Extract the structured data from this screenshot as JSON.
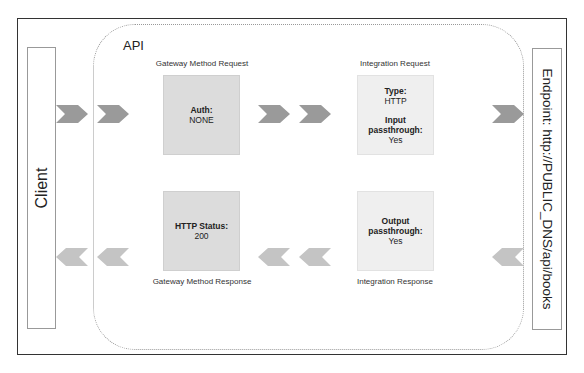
{
  "diagram": {
    "api_label": "API",
    "client_label": "Client",
    "endpoint_label": "Endpoint: http://PUBLIC_DNS/api/books",
    "request_flow": {
      "method_request": {
        "caption": "Gateway Method Request",
        "fields": [
          {
            "key": "Auth:",
            "value": "NONE"
          }
        ]
      },
      "integration_request": {
        "caption": "Integration Request",
        "fields": [
          {
            "key": "Type:",
            "value": "HTTP"
          },
          {
            "key": "Input passthrough:",
            "value": "Yes"
          }
        ]
      }
    },
    "response_flow": {
      "method_response": {
        "caption": "Gateway Method Response",
        "fields": [
          {
            "key": "HTTP Status:",
            "value": "200"
          }
        ]
      },
      "integration_response": {
        "caption": "Integration Response",
        "fields": [
          {
            "key": "Output passthrough:",
            "value": "Yes"
          }
        ]
      }
    },
    "colors": {
      "chevron_request": "#9a9a9a",
      "chevron_response": "#c4c4c4",
      "stage_dark": "#dcdcdc",
      "stage_light": "#efefef",
      "frame_border": "#333333"
    }
  }
}
